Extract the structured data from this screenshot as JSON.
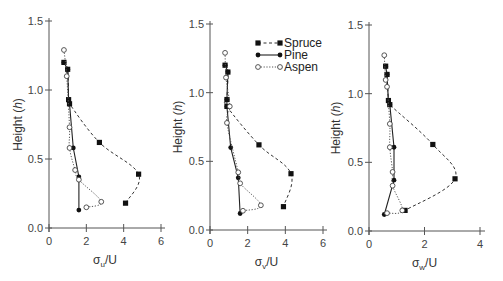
{
  "chart_data": [
    {
      "type": "line",
      "title": "",
      "xlabel": "σu/U",
      "xlabel_main": "σ",
      "xlabel_sub": "u",
      "xlabel_tail": "/U",
      "ylabel": "Height (h)",
      "xlim": [
        0,
        6
      ],
      "ylim": [
        0,
        1.5
      ],
      "xticks": [
        0,
        2,
        4,
        6
      ],
      "yticks": [
        0.0,
        0.5,
        1.0,
        1.5
      ],
      "ytick_labels": [
        "0.0",
        "0.5",
        "1.0",
        "1.5"
      ],
      "grid": false,
      "series": [
        {
          "name": "Spruce",
          "x": [
            0.8,
            1.0,
            1.05,
            1.1,
            2.7,
            4.8,
            4.1
          ],
          "y": [
            1.2,
            1.15,
            0.93,
            0.9,
            0.62,
            0.39,
            0.18
          ]
        },
        {
          "name": "Pine",
          "x": [
            0.8,
            1.0,
            1.05,
            1.1,
            1.3,
            1.6,
            1.6
          ],
          "y": [
            1.2,
            1.15,
            0.93,
            0.9,
            0.58,
            0.37,
            0.13
          ]
        },
        {
          "name": "Aspen",
          "x": [
            0.8,
            0.95,
            1.1,
            1.1,
            1.4,
            1.6,
            2.8,
            2.0
          ],
          "y": [
            1.29,
            1.1,
            0.73,
            0.58,
            0.42,
            0.35,
            0.19,
            0.15
          ]
        }
      ]
    },
    {
      "type": "line",
      "title": "",
      "xlabel": "σv/U",
      "xlabel_main": "σ",
      "xlabel_sub": "v",
      "xlabel_tail": "/U",
      "ylabel": "Height (h)",
      "xlim": [
        0,
        6
      ],
      "ylim": [
        0,
        1.5
      ],
      "xticks": [
        0,
        2,
        4,
        6
      ],
      "yticks": [
        0.0,
        0.5,
        1.0,
        1.5
      ],
      "ytick_labels": [
        "0.0",
        "0.5",
        "1.0",
        "1.5"
      ],
      "grid": false,
      "legend_position": "upper right",
      "series": [
        {
          "name": "Spruce",
          "x": [
            0.8,
            0.95,
            0.9,
            0.9,
            2.6,
            4.3,
            3.9
          ],
          "y": [
            1.2,
            1.15,
            0.95,
            0.9,
            0.62,
            0.41,
            0.17
          ]
        },
        {
          "name": "Pine",
          "x": [
            0.8,
            0.95,
            0.9,
            0.9,
            1.1,
            1.5,
            1.6
          ],
          "y": [
            1.2,
            1.15,
            0.95,
            0.9,
            0.6,
            0.38,
            0.12
          ]
        },
        {
          "name": "Aspen",
          "x": [
            0.8,
            0.85,
            1.05,
            0.9,
            1.5,
            1.6,
            2.7,
            1.75
          ],
          "y": [
            1.29,
            1.11,
            0.9,
            0.78,
            0.42,
            0.34,
            0.18,
            0.14
          ]
        }
      ]
    },
    {
      "type": "line",
      "title": "",
      "xlabel": "σw/U",
      "xlabel_main": "σ",
      "xlabel_sub": "w",
      "xlabel_tail": "/U",
      "ylabel": "Height (h)",
      "xlim": [
        0,
        4
      ],
      "ylim": [
        0,
        1.5
      ],
      "xticks": [
        0,
        2,
        4
      ],
      "yticks": [
        0.0,
        0.5,
        1.0,
        1.5
      ],
      "ytick_labels": [
        "0.0",
        "0.5",
        "1.0",
        "1.5"
      ],
      "grid": false,
      "series": [
        {
          "name": "Spruce",
          "x": [
            0.6,
            0.65,
            0.7,
            0.75,
            2.3,
            3.1,
            1.3
          ],
          "y": [
            1.2,
            1.14,
            0.95,
            0.92,
            0.63,
            0.38,
            0.15
          ]
        },
        {
          "name": "Pine",
          "x": [
            0.6,
            0.65,
            0.7,
            0.75,
            0.9,
            0.9,
            0.55
          ],
          "y": [
            1.2,
            1.14,
            0.95,
            0.92,
            0.61,
            0.37,
            0.12
          ]
        },
        {
          "name": "Aspen",
          "x": [
            0.55,
            0.6,
            0.65,
            0.75,
            0.75,
            0.85,
            0.85,
            1.2,
            0.65
          ],
          "y": [
            1.28,
            1.1,
            1.05,
            0.78,
            0.61,
            0.43,
            0.33,
            0.15,
            0.13
          ]
        }
      ]
    }
  ],
  "legend": {
    "items": [
      {
        "label": "Spruce",
        "marker": "filled-square",
        "line": "dashed"
      },
      {
        "label": "Pine",
        "marker": "filled-circle",
        "line": "solid"
      },
      {
        "label": "Aspen",
        "marker": "open-circle",
        "line": "dotted"
      }
    ]
  },
  "layout": {
    "panels": [
      {
        "x0": 49,
        "x1": 161,
        "axis_end": 165,
        "y0": 228,
        "y1": 21
      },
      {
        "x0": 210,
        "x1": 323,
        "axis_end": 327,
        "y0": 230,
        "y1": 24
      },
      {
        "x0": 369,
        "x1": 480,
        "axis_end": 485,
        "y0": 231,
        "y1": 25
      }
    ],
    "ylabel_x": [
      22,
      182,
      340
    ],
    "legend_x": 258,
    "legend_y": 43
  }
}
